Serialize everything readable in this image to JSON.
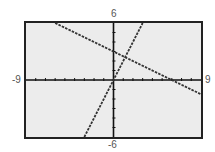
{
  "window": {
    "xmin_label": "-9",
    "xmax_label": "9",
    "ymin_label": "-6",
    "ymax_label": "6"
  },
  "colors": {
    "screen_bg": "#ececec",
    "frame": "#222222",
    "line": "#333333"
  },
  "chart_data": {
    "type": "line",
    "title": "",
    "xlabel": "",
    "ylabel": "",
    "xlim": [
      -9,
      9
    ],
    "ylim": [
      -6,
      6
    ],
    "x_tick_step": 1,
    "y_tick_step": 1,
    "grid": false,
    "legend": null,
    "series": [
      {
        "name": "y = -0.5x + 3",
        "x": [
          -6,
          9
        ],
        "y": [
          6,
          -1.5
        ],
        "style": "dashed"
      },
      {
        "name": "y = 2x",
        "x": [
          -3,
          3
        ],
        "y": [
          -6,
          6
        ],
        "style": "dashed"
      }
    ],
    "annotations": [
      "-9",
      "9",
      "-6",
      "6"
    ]
  }
}
